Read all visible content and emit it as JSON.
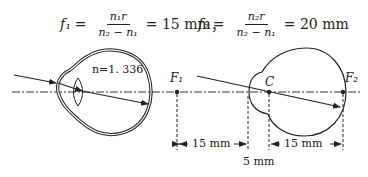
{
  "formula": {
    "f1": {
      "lhs": "f₁",
      "numerator": "n₁r",
      "denominator": "n₂ − n₁",
      "rhs": "= 15 mm",
      "sep": "，"
    },
    "f2": {
      "lhs": "f₂",
      "numerator": "n₂r",
      "denominator": "n₂ − n₁",
      "rhs": "= 20 mm"
    }
  },
  "diagram": {
    "refractive_index_label": "n=1. 336",
    "point_F1": "F₁",
    "point_C": "C",
    "point_F2": "F₂",
    "dim_left": "15 mm",
    "dim_right": "15 mm",
    "dim_gap": "5 mm"
  },
  "colors": {
    "stroke": "#222222",
    "background": "#ffffff"
  }
}
